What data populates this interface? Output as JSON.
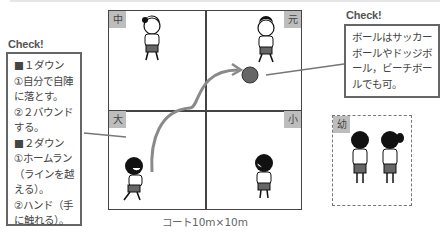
{
  "left_note": {
    "heading": "Check!",
    "lines": [
      "■１ダウン",
      "①自分で自陣",
      "に落とす。",
      "②２バウンド",
      "する。",
      "■２ダウン",
      "①ホームラン",
      "（ラインを越",
      "える）。",
      "②ハンド（手",
      "に触れる）。"
    ]
  },
  "right_note": {
    "heading": "Check!",
    "lines": [
      "ボールはサッカー",
      "ボールやドッジボ",
      "ール，ビーチボー",
      "ルでも可。"
    ]
  },
  "court": {
    "zones": {
      "top_left": "中",
      "top_right": "元",
      "bottom_left": "大",
      "bottom_right": "小"
    },
    "caption": "コート10m×10m"
  },
  "waiting_area": {
    "label": "幼"
  },
  "colors": {
    "tag_bg": "#bdbdbd",
    "ball": "#666666",
    "arrow": "#888888",
    "border": "#444444"
  }
}
